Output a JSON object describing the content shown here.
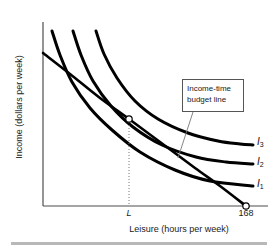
{
  "figure": {
    "title_present": false,
    "background_color": "#ffffff",
    "ink_color": "#000000",
    "bottom_rule_color": "#b8b8b8"
  },
  "axes": {
    "y_title": "Income (dollars per week)",
    "x_title": "Leisure (hours per week)",
    "origin_px": [
      43,
      206
    ],
    "x_axis_end_px": [
      268,
      206
    ],
    "y_axis_top_px": [
      43,
      22
    ]
  },
  "ticks": {
    "x": [
      {
        "label": "L",
        "italic": true,
        "x_px": 129
      },
      {
        "label": "168",
        "italic": false,
        "x_px": 246
      }
    ],
    "y": []
  },
  "callout": {
    "line1": "Income-time",
    "line2": "budget line",
    "box_px": [
      182,
      79,
      62,
      33
    ],
    "leader_from_px": [
      193,
      112
    ],
    "leader_to_px": [
      178,
      158
    ]
  },
  "curve_labels": [
    {
      "name": "I3",
      "base": "I",
      "sub": "3"
    },
    {
      "name": "I2",
      "base": "I",
      "sub": "2"
    },
    {
      "name": "I1",
      "base": "I",
      "sub": "1"
    }
  ],
  "markers": {
    "tangency_point_px": [
      129,
      119
    ],
    "x_intercept_point_px": [
      246,
      206
    ],
    "style": "open-circle-white-fill-black-stroke"
  },
  "chart_data": {
    "type": "line",
    "title": "",
    "xlabel": "Leisure (hours per week)",
    "ylabel": "Income (dollars per week)",
    "xlim": [
      0,
      180
    ],
    "ylim": [
      0,
      100
    ],
    "grid": false,
    "legend_position": "right-inline",
    "annotations": [
      {
        "text": "Income-time budget line",
        "points_to": "budget-line",
        "at_px": [
          182,
          79
        ]
      },
      {
        "text": "L",
        "axis": "x",
        "value_px": 129,
        "style": "italic"
      },
      {
        "text": "168",
        "axis": "x",
        "value_px": 246
      }
    ],
    "series": [
      {
        "name": "Income-time budget line",
        "kind": "budget-line",
        "stroke_width": 2.6,
        "points_px": [
          [
            43,
            53
          ],
          [
            70,
            74
          ],
          [
            100,
            98
          ],
          [
            129,
            119
          ],
          [
            160,
            142
          ],
          [
            195,
            168
          ],
          [
            220,
            186
          ],
          [
            246,
            206
          ]
        ],
        "endpoints": {
          "y_intercept_px": [
            43,
            53
          ],
          "x_intercept_px": [
            246,
            206
          ]
        }
      },
      {
        "name": "I1",
        "kind": "indifference-curve",
        "stroke_width": 3.0,
        "points_px": [
          [
            52,
            31
          ],
          [
            60,
            55
          ],
          [
            72,
            82
          ],
          [
            90,
            108
          ],
          [
            112,
            130
          ],
          [
            140,
            152
          ],
          [
            175,
            170
          ],
          [
            210,
            181
          ],
          [
            253,
            186
          ]
        ],
        "label_at_px": [
          257,
          178
        ]
      },
      {
        "name": "I2",
        "kind": "indifference-curve",
        "stroke_width": 3.0,
        "points_px": [
          [
            73,
            31
          ],
          [
            81,
            55
          ],
          [
            93,
            81
          ],
          [
            111,
            106
          ],
          [
            133,
            127
          ],
          [
            162,
            145
          ],
          [
            196,
            157
          ],
          [
            226,
            162
          ],
          [
            253,
            164
          ]
        ],
        "label_at_px": [
          257,
          156
        ]
      },
      {
        "name": "I3",
        "kind": "indifference-curve",
        "stroke_width": 3.0,
        "points_px": [
          [
            96,
            31
          ],
          [
            104,
            54
          ],
          [
            117,
            78
          ],
          [
            135,
            101
          ],
          [
            158,
            119
          ],
          [
            188,
            133
          ],
          [
            218,
            141
          ],
          [
            240,
            144
          ],
          [
            253,
            145
          ]
        ],
        "label_at_px": [
          257,
          136
        ]
      }
    ],
    "tangency": {
      "description": "Budget line tangent to I2 at leisure = L",
      "px": [
        129,
        119
      ],
      "x_label": "L"
    },
    "dotted_drop_line": {
      "from_px": [
        129,
        119
      ],
      "to_px": [
        129,
        206
      ],
      "style": "dotted"
    }
  }
}
